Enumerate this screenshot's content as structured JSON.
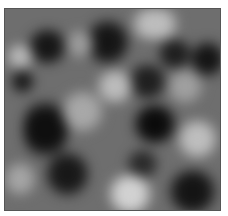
{
  "image": {
    "description": "Grayscale cloud / plasma noise texture inside a thin dark frame",
    "colors": {
      "background": "#ffffff",
      "frame_border": "#555555",
      "base_gray": "#6e6e6e",
      "dark": "#0e0e0e",
      "light": "#cfcfcf"
    },
    "blobs": [
      {
        "x": 20,
        "y": 20,
        "w": 45,
        "h": 35,
        "c": "#161616"
      },
      {
        "x": 80,
        "y": 8,
        "w": 45,
        "h": 50,
        "c": "#151515"
      },
      {
        "x": 150,
        "y": 30,
        "w": 40,
        "h": 30,
        "c": "#1e1e1e"
      },
      {
        "x": 185,
        "y": 30,
        "w": 35,
        "h": 40,
        "c": "#141414"
      },
      {
        "x": 5,
        "y": 60,
        "w": 25,
        "h": 25,
        "c": "#1a1a1a"
      },
      {
        "x": 18,
        "y": 85,
        "w": 45,
        "h": 70,
        "c": "#0f0f0f"
      },
      {
        "x": 125,
        "y": 95,
        "w": 50,
        "h": 40,
        "c": "#0b0b0b"
      },
      {
        "x": 120,
        "y": 55,
        "w": 45,
        "h": 35,
        "c": "#1f1f1f"
      },
      {
        "x": 40,
        "y": 140,
        "w": 45,
        "h": 50,
        "c": "#181818"
      },
      {
        "x": 160,
        "y": 160,
        "w": 55,
        "h": 45,
        "c": "#141414"
      },
      {
        "x": 120,
        "y": 140,
        "w": 35,
        "h": 30,
        "c": "#2a2a2a"
      },
      {
        "x": 120,
        "y": 0,
        "w": 60,
        "h": 30,
        "c": "#bdbdbd"
      },
      {
        "x": 0,
        "y": 35,
        "w": 30,
        "h": 25,
        "c": "#b8b8b8"
      },
      {
        "x": 90,
        "y": 60,
        "w": 40,
        "h": 35,
        "c": "#bcbcbc"
      },
      {
        "x": 55,
        "y": 80,
        "w": 45,
        "h": 45,
        "c": "#a8a8a8"
      },
      {
        "x": 170,
        "y": 110,
        "w": 45,
        "h": 40,
        "c": "#bebebe"
      },
      {
        "x": 100,
        "y": 165,
        "w": 50,
        "h": 40,
        "c": "#d2d2d2"
      },
      {
        "x": 0,
        "y": 150,
        "w": 30,
        "h": 40,
        "c": "#a5a5a5"
      },
      {
        "x": 160,
        "y": 60,
        "w": 40,
        "h": 35,
        "c": "#a0a0a0"
      },
      {
        "x": 60,
        "y": 20,
        "w": 30,
        "h": 30,
        "c": "#9c9c9c"
      }
    ]
  }
}
